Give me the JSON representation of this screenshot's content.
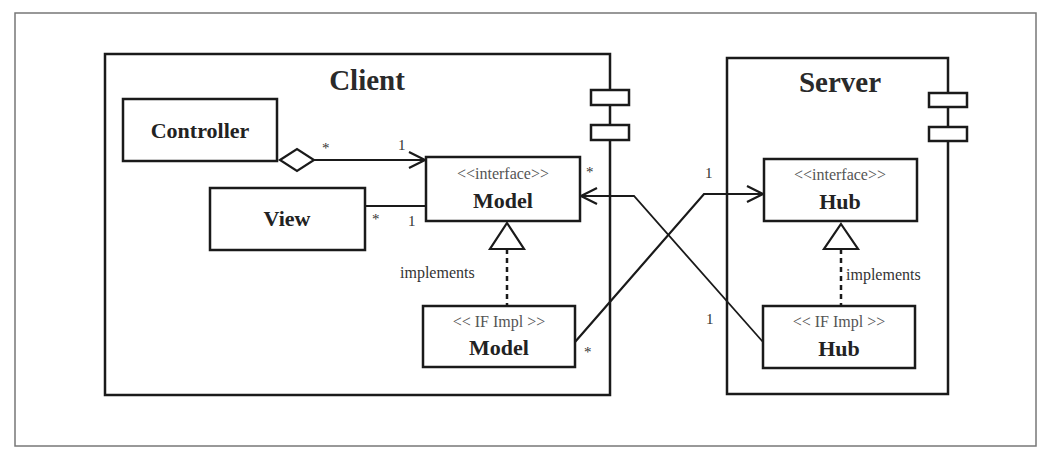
{
  "diagram": {
    "type": "UML component/class diagram",
    "packages": {
      "client": {
        "title": "Client"
      },
      "server": {
        "title": "Server"
      }
    },
    "classes": {
      "controller": {
        "name": "Controller"
      },
      "view": {
        "name": "View"
      },
      "model_interface": {
        "stereotype": "<<interface>>",
        "name": "Model"
      },
      "model_impl": {
        "stereotype": "<< IF Impl >>",
        "name": "Model"
      },
      "hub_interface": {
        "stereotype": "<<interface>>",
        "name": "Hub"
      },
      "hub_impl": {
        "stereotype": "<< IF Impl >>",
        "name": "Hub"
      }
    },
    "relations": {
      "controller_model": {
        "type": "aggregation-navigable",
        "from_mult": "*",
        "to_mult": "1"
      },
      "view_model": {
        "type": "association",
        "from_mult": "*",
        "to_mult": "1"
      },
      "model_impl_realizes": {
        "type": "realization",
        "label": "implements"
      },
      "hub_impl_realizes": {
        "type": "realization",
        "label": "implements"
      },
      "model_impl_to_hub": {
        "type": "navigable-association",
        "from_mult": "*",
        "to_mult": "1"
      },
      "hub_impl_to_model": {
        "type": "navigable-association",
        "from_mult": "1",
        "to_mult": "*"
      }
    },
    "colors": {
      "stroke": "#1a1a1a",
      "frame": "#777777",
      "background": "#ffffff"
    }
  }
}
